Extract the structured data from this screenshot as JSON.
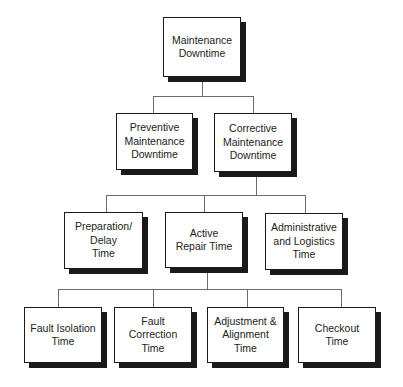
{
  "diagram": {
    "type": "hierarchy",
    "root": {
      "id": "n0",
      "label": "Maintenance\nDowntime"
    },
    "level2": [
      {
        "id": "n1",
        "label": "Preventive\nMaintenance\nDowntime"
      },
      {
        "id": "n2",
        "label": "Corrective\nMaintenance\nDowntime"
      }
    ],
    "level3": [
      {
        "id": "n3",
        "label": "Preparation/\nDelay\nTime"
      },
      {
        "id": "n4",
        "label": "Active\nRepair Time"
      },
      {
        "id": "n5",
        "label": "Administrative\nand Logistics\nTime"
      }
    ],
    "level4": [
      {
        "id": "n6",
        "label": "Fault Isolation\nTime"
      },
      {
        "id": "n7",
        "label": "Fault\nCorrection\nTime"
      },
      {
        "id": "n8",
        "label": "Adjustment &\nAlignment\nTime"
      },
      {
        "id": "n9",
        "label": "Checkout\nTime"
      }
    ],
    "edges": [
      [
        "n0",
        "n1"
      ],
      [
        "n0",
        "n2"
      ],
      [
        "n2",
        "n3"
      ],
      [
        "n2",
        "n4"
      ],
      [
        "n2",
        "n5"
      ],
      [
        "n4",
        "n6"
      ],
      [
        "n4",
        "n7"
      ],
      [
        "n4",
        "n8"
      ],
      [
        "n4",
        "n9"
      ]
    ]
  }
}
